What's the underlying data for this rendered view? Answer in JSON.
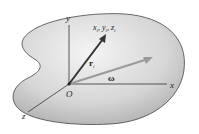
{
  "diagram": {
    "axes": {
      "x": "x",
      "y": "y",
      "z": "z"
    },
    "origin_label": "O",
    "position_vector_label": "r",
    "position_vector_subscript": "i",
    "point_label": "x",
    "point_label_parts": [
      "x",
      "i",
      ", y",
      "i",
      ", z",
      "i"
    ],
    "angular_velocity_label": "ω",
    "colors": {
      "body_fill_light": "#f2f2f2",
      "body_fill_dark": "#b8b8b8",
      "outline": "#333333",
      "axis": "#333333",
      "r_vector": "#333333",
      "omega_vector": "#999999"
    }
  }
}
